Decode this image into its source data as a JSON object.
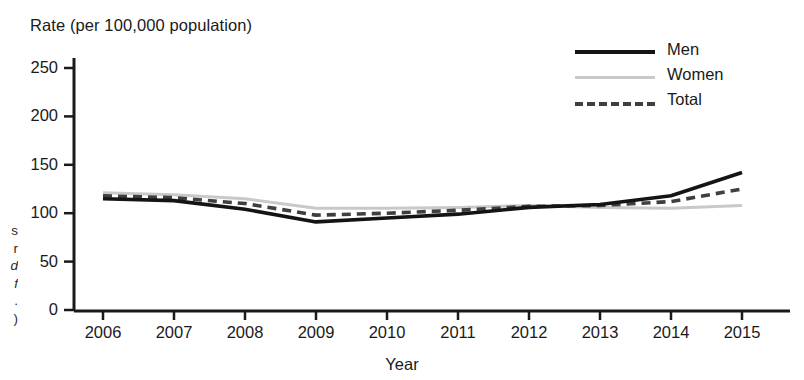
{
  "chart_data": {
    "type": "line",
    "title": "",
    "ylabel": "Rate (per 100,000 population)",
    "xlabel": "Year",
    "categories": [
      "2006",
      "2007",
      "2008",
      "2009",
      "2010",
      "2011",
      "2012",
      "2013",
      "2014",
      "2015"
    ],
    "x": [
      2006,
      2007,
      2008,
      2009,
      2010,
      2011,
      2012,
      2013,
      2014,
      2015
    ],
    "ylim": [
      0,
      260
    ],
    "xlim": [
      2006,
      2015
    ],
    "yticks": [
      "0",
      "50",
      "100",
      "150",
      "200",
      "250"
    ],
    "ytick_values": [
      0,
      50,
      100,
      150,
      200,
      250
    ],
    "grid": false,
    "legend_position": "top-right",
    "series": [
      {
        "name": "Men",
        "color": "#141414",
        "style": "solid",
        "values": [
          115,
          113,
          104,
          91,
          95,
          99,
          106,
          109,
          118,
          142
        ]
      },
      {
        "name": "Women",
        "color": "#c9c9c9",
        "style": "solid",
        "values": [
          121,
          119,
          115,
          105,
          105,
          106,
          108,
          106,
          105,
          108
        ]
      },
      {
        "name": "Total",
        "color": "#3f3f3f",
        "style": "dashed",
        "values": [
          118,
          116,
          110,
          98,
          100,
          103,
          107,
          108,
          112,
          125
        ]
      }
    ]
  },
  "axes": {
    "y_title": "Rate (per 100,000 population)",
    "x_title": "Year"
  },
  "legend": {
    "items": [
      {
        "label": "Men",
        "key": "men"
      },
      {
        "label": "Women",
        "key": "women"
      },
      {
        "label": "Total",
        "key": "total"
      }
    ]
  },
  "caption_fragment": {
    "line1": "s",
    "line2": "r",
    "line3": "d",
    "line4": "f",
    "line5": ".",
    "line6": ")"
  },
  "colors": {
    "men": "#141414",
    "women": "#c9c9c9",
    "total": "#3f3f3f",
    "axis": "#1a1a1a",
    "background": "#ffffff"
  }
}
